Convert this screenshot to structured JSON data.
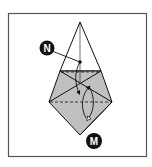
{
  "diagram": {
    "type": "origami-fold-step",
    "frame": {
      "x": 8,
      "y": 13,
      "width": 139,
      "height": 144,
      "stroke": "#555555"
    },
    "colors": {
      "shade": "#c0c0c0",
      "line": "#111111",
      "paper": "#ffffff"
    },
    "labels": [
      {
        "id": "N",
        "text": "N",
        "cx": 47,
        "cy": 48
      },
      {
        "id": "M",
        "text": "M",
        "cx": 94,
        "cy": 141
      }
    ]
  }
}
